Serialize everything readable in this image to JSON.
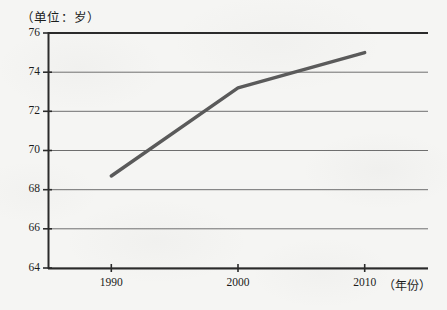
{
  "chart_data": {
    "type": "line",
    "title": "",
    "unit_note": "（单位：岁）",
    "xlabel": "（年份）",
    "ylabel": "",
    "x": [
      1990,
      2000,
      2010
    ],
    "categories": [
      "1990",
      "2000",
      "2010"
    ],
    "values": [
      68.7,
      73.2,
      75.0
    ],
    "series": [
      {
        "name": "人均预期寿命",
        "values": [
          68.7,
          73.2,
          75.0
        ]
      }
    ],
    "ylim": [
      64,
      76
    ],
    "yticks": [
      64,
      66,
      68,
      70,
      72,
      74,
      76
    ],
    "ytick_labels": [
      "64",
      "66",
      "68",
      "70",
      "72",
      "74",
      "76"
    ],
    "xticks": [
      1990,
      2000,
      2010
    ],
    "xtick_labels": [
      "1990",
      "2000",
      "2010"
    ],
    "xlim": [
      1985,
      2015
    ],
    "grid": true,
    "grid_axis": "y",
    "legend": false,
    "legend_position": "none",
    "annotations": [],
    "line_color": "#5a5a5a",
    "grid_color": "#6e6e6e",
    "axis_color": "#2a2a2a",
    "background_color": "#f5f5f3"
  },
  "axes": {
    "unit_note": "（单位：岁）",
    "x_axis_title": "（年份）"
  }
}
